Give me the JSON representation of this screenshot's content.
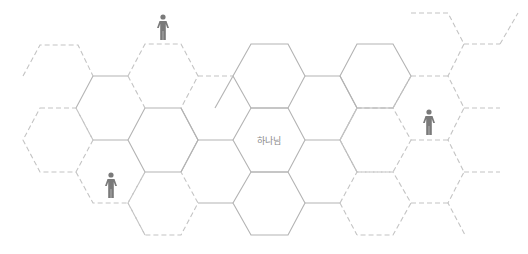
{
  "diagram": {
    "type": "hexagon-grid",
    "center_label": "하나님",
    "colors": {
      "solid_edge": "#b3b3b3",
      "dashed_edge": "#c4c4c4",
      "label": "#8a8a8a",
      "person": "#7a7a7a",
      "background": "#ffffff"
    },
    "center_hex": {
      "x": 269,
      "y": 140
    },
    "persons": [
      {
        "name": "person-top",
        "x": 163,
        "y": 27
      },
      {
        "name": "person-right",
        "x": 429,
        "y": 122
      },
      {
        "name": "person-bottom-left",
        "x": 111,
        "y": 185
      }
    ],
    "icons": [
      "person-icon",
      "person-icon",
      "person-icon"
    ]
  }
}
